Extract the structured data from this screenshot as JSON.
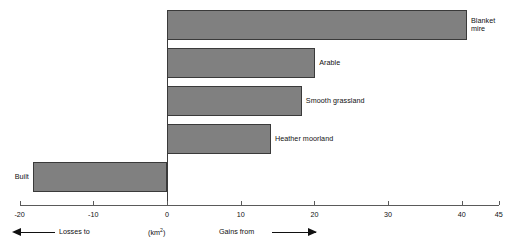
{
  "chart_data": {
    "type": "bar",
    "orientation": "horizontal",
    "title": "",
    "xlabel": "(km²)",
    "ylabel": "",
    "xlim": [
      -20,
      45
    ],
    "grid": false,
    "legend": null,
    "categories": [
      "Blanket mire",
      "Arable",
      "Smooth grassland",
      "Heather moorland",
      "Built"
    ],
    "values": [
      40.7,
      20.1,
      18.3,
      14.1,
      -18.2
    ],
    "tick_labels": [
      "-20",
      "-10",
      "0",
      "10",
      "20",
      "30",
      "40",
      "45"
    ],
    "tick_values": [
      -20,
      -10,
      0,
      10,
      20,
      30,
      40,
      45
    ],
    "annotations": {
      "left": "Losses to",
      "center": "(km2)",
      "right": "Gains from"
    },
    "colors": {
      "bar_fill": "#808080",
      "bar_stroke": "#3a3a3a",
      "axis": "#5a5a5a",
      "text": "#111111",
      "background": "#ffffff"
    }
  },
  "bars": [
    {
      "label": "Blanket\nmire",
      "value": 40.7
    },
    {
      "label": "Arable",
      "value": 20.1
    },
    {
      "label": "Smooth grassland",
      "value": 18.3
    },
    {
      "label": "Heather moorland",
      "value": 14.1
    },
    {
      "label": "Built",
      "value": -18.2
    }
  ],
  "axis": {
    "ticks": [
      {
        "label": "-20",
        "value": -20
      },
      {
        "label": "-10",
        "value": -10
      },
      {
        "label": "0",
        "value": 0
      },
      {
        "label": "10",
        "value": 10
      },
      {
        "label": "20",
        "value": 20
      },
      {
        "label": "30",
        "value": 30
      },
      {
        "label": "40",
        "value": 40
      },
      {
        "label": "45",
        "value": 45
      }
    ]
  },
  "footer": {
    "losses_label": "Losses to",
    "unit_label_prefix": "(km",
    "unit_label_sup": "2",
    "unit_label_suffix": ")",
    "gains_label": "Gains from"
  }
}
